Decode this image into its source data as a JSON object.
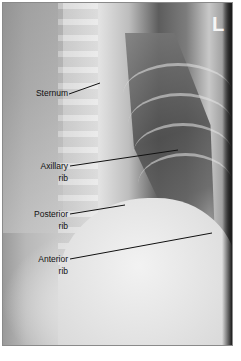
{
  "image": {
    "description": "Lateral-oblique chest radiograph with anatomical labels",
    "side_marker": "L",
    "frame_color": "#8a8a8a"
  },
  "labels": [
    {
      "id": "sternum",
      "line1": "Sternum",
      "line2": ""
    },
    {
      "id": "axillary-rib",
      "line1": "Axillary",
      "line2": "rib"
    },
    {
      "id": "posterior-rib",
      "line1": "Posterior",
      "line2": "rib"
    },
    {
      "id": "anterior-rib",
      "line1": "Anterior",
      "line2": "rib"
    }
  ]
}
